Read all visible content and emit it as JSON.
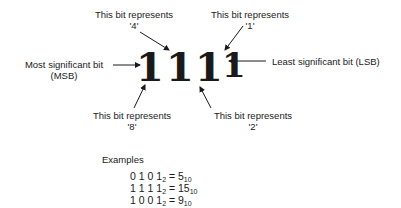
{
  "bits": [
    "1",
    "1",
    "1",
    "1"
  ],
  "labels": {
    "bit4": {
      "line1": "This bit represents",
      "line2": "'4'"
    },
    "bit1": {
      "line1": "This bit represents",
      "line2": "'1'"
    },
    "bit8": {
      "line1": "This bit represents",
      "line2": "'8'"
    },
    "bit2": {
      "line1": "This bit represents",
      "line2": "'2'"
    },
    "msb": {
      "line1": "Most significant bit",
      "line2": "(MSB)"
    },
    "lsb": "Least significant bit (LSB)"
  },
  "examples": {
    "title": "Examples",
    "rows": [
      {
        "binary": "0 1 0 1",
        "base": "2",
        "eq": " = ",
        "decimal": "5",
        "dbase": "10"
      },
      {
        "binary": "1 1 1 1",
        "base": "2",
        "eq": " = ",
        "decimal": "15",
        "dbase": "10"
      },
      {
        "binary": "1 0 0 1",
        "base": "2",
        "eq": " = ",
        "decimal": "9",
        "dbase": "10"
      }
    ]
  }
}
